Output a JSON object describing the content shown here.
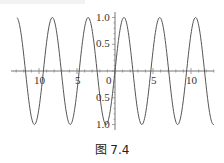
{
  "chart_data": {
    "type": "line",
    "title": "",
    "caption": "图 7.4",
    "function_hint": "y = sin(4x/3)",
    "xlabel": "",
    "ylabel": "",
    "xlim": [
      -13.2,
      14
    ],
    "ylim": [
      -1.0,
      1.0
    ],
    "x_ticks": [
      {
        "value": -10,
        "label": "10"
      },
      {
        "value": -5,
        "label": "5"
      },
      {
        "value": 0,
        "label": "0"
      },
      {
        "value": 5,
        "label": "5"
      },
      {
        "value": 10,
        "label": "10"
      }
    ],
    "y_ticks": [
      {
        "value": 1.0,
        "label": "1.0"
      },
      {
        "value": 0.5,
        "label": "0.5"
      },
      {
        "value": -0.5,
        "label": "0.5"
      },
      {
        "value": -1.0,
        "label": "1.0"
      }
    ],
    "grid": false,
    "legend": null,
    "series": [
      {
        "name": "sin(4x/3)",
        "amplitude": 1.0,
        "period": 4.712,
        "phase": 0,
        "peaks_x": [
          -12.96,
          -8.25,
          -3.53,
          1.18,
          5.89,
          10.6
        ],
        "troughs_x": [
          -10.6,
          -5.89,
          -1.18,
          3.53,
          8.25,
          12.96
        ],
        "zeros_x": [
          -11.78,
          -9.42,
          -7.07,
          -4.71,
          -2.36,
          0,
          2.36,
          4.71,
          7.07,
          9.42,
          11.78
        ]
      }
    ]
  },
  "figure": {
    "caption": "图 7.4"
  },
  "axes": {
    "x_labels": [
      "10",
      "5",
      "0",
      "5",
      "10"
    ],
    "y_labels": [
      "1.0",
      "0.5",
      "0.5",
      "1.0"
    ]
  }
}
